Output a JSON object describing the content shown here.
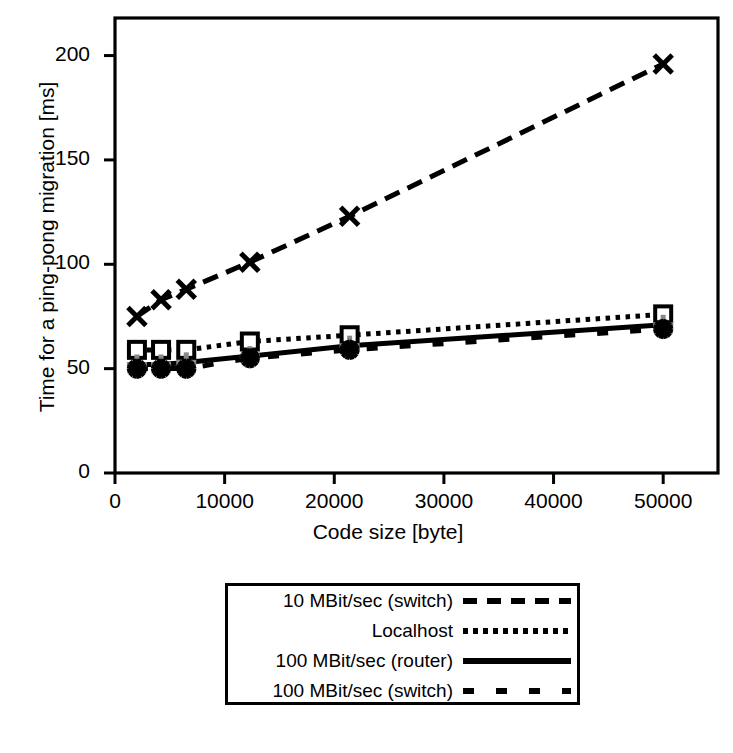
{
  "chart_data": {
    "type": "line",
    "title": "",
    "xlabel": "Code size [byte]",
    "ylabel": "Time for a ping-pong migration [ms]",
    "xlim": [
      0,
      55000
    ],
    "ylim": [
      0,
      218
    ],
    "xticks": [
      0,
      10000,
      20000,
      30000,
      40000,
      50000
    ],
    "xtick_labels": [
      "0",
      "10000",
      "20000",
      "30000",
      "40000",
      "50000"
    ],
    "yticks": [
      0,
      50,
      100,
      150,
      200
    ],
    "ytick_labels": [
      "0",
      "50",
      "100",
      "150",
      "200"
    ],
    "grid": false,
    "legend_position": "below-center",
    "series": [
      {
        "name": "10 MBit/sec (switch)",
        "marker": "x-cross",
        "linestyle": "dashed-long",
        "color": "#000000",
        "x": [
          2000,
          4200,
          6500,
          12300,
          21400,
          50000
        ],
        "y": [
          75,
          83,
          88,
          101,
          123,
          196
        ]
      },
      {
        "name": "Localhost",
        "marker": "open-square",
        "linestyle": "dotted",
        "color": "#000000",
        "x": [
          2000,
          4200,
          6500,
          12300,
          21400,
          50000
        ],
        "y": [
          59,
          59,
          59,
          63,
          66,
          76
        ]
      },
      {
        "name": "100 MBit/sec (router)",
        "marker": "grey-plus",
        "linestyle": "solid",
        "color": "#000000",
        "marker_color": "#888888",
        "x": [
          2000,
          4200,
          6500,
          12300,
          21400,
          50000
        ],
        "y": [
          52,
          52,
          53,
          56,
          61,
          71
        ]
      },
      {
        "name": "100 MBit/sec (switch)",
        "marker": "asterisk",
        "linestyle": "dashed-short",
        "color": "#000000",
        "x": [
          2000,
          4200,
          6500,
          12300,
          21400,
          50000
        ],
        "y": [
          50,
          50,
          50,
          55,
          59,
          69
        ]
      }
    ]
  },
  "legend": {
    "entries": [
      {
        "label": "10 MBit/sec (switch)",
        "style": "dashed-long"
      },
      {
        "label": "Localhost",
        "style": "dotted"
      },
      {
        "label": "100 MBit/sec (router)",
        "style": "solid"
      },
      {
        "label": "100 MBit/sec (switch)",
        "style": "dashed-short"
      }
    ]
  }
}
